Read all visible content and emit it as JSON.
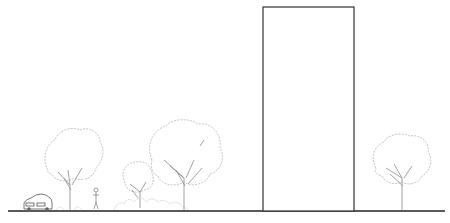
{
  "drawing": {
    "type": "site section elevation",
    "elements": [
      {
        "kind": "car",
        "label": "car"
      },
      {
        "kind": "tree",
        "label": "tree-left"
      },
      {
        "kind": "person",
        "label": "pedestrian"
      },
      {
        "kind": "shrub",
        "label": "shrub-small-tree"
      },
      {
        "kind": "tree",
        "label": "tree-center"
      },
      {
        "kind": "building",
        "label": "tall-building"
      },
      {
        "kind": "tree",
        "label": "tree-right"
      }
    ],
    "colors": {
      "ground": "#222222",
      "building_outline": "#333333",
      "vegetation": "#b8b8b8"
    }
  }
}
